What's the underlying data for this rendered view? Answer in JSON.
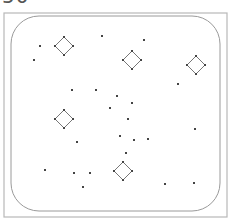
{
  "header": {
    "score_text": "50"
  },
  "board": {
    "outer": {
      "x": 4,
      "y": 13,
      "w": 223,
      "h": 204,
      "stroke": "#b8b8b8"
    },
    "inner": {
      "x": 11,
      "y": 16,
      "w": 209,
      "h": 195,
      "r": 28,
      "stroke": "#9a9a9a"
    },
    "diamond_radius": 9,
    "diamonds": [
      {
        "cx": 64,
        "cy": 46
      },
      {
        "cx": 132,
        "cy": 60
      },
      {
        "cx": 196,
        "cy": 65
      },
      {
        "cx": 64,
        "cy": 119
      },
      {
        "cx": 123,
        "cy": 171
      }
    ],
    "points": [
      {
        "x": 40,
        "y": 46
      },
      {
        "x": 34,
        "y": 60
      },
      {
        "x": 102,
        "y": 36
      },
      {
        "x": 144,
        "y": 40
      },
      {
        "x": 178,
        "y": 84
      },
      {
        "x": 72,
        "y": 90
      },
      {
        "x": 96,
        "y": 90
      },
      {
        "x": 117,
        "y": 96
      },
      {
        "x": 132,
        "y": 103
      },
      {
        "x": 110,
        "y": 108
      },
      {
        "x": 128,
        "y": 119
      },
      {
        "x": 195,
        "y": 129
      },
      {
        "x": 120,
        "y": 136
      },
      {
        "x": 134,
        "y": 140
      },
      {
        "x": 148,
        "y": 139
      },
      {
        "x": 126,
        "y": 153
      },
      {
        "x": 77,
        "y": 142
      },
      {
        "x": 45,
        "y": 170
      },
      {
        "x": 74,
        "y": 173
      },
      {
        "x": 90,
        "y": 173
      },
      {
        "x": 83,
        "y": 187
      },
      {
        "x": 165,
        "y": 184
      },
      {
        "x": 194,
        "y": 183
      }
    ],
    "point_color": "#444444",
    "diamond_stroke": "#777777"
  }
}
